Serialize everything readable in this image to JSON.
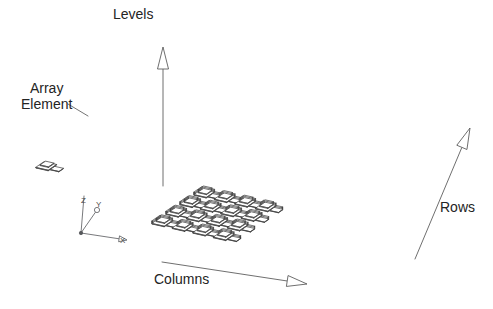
{
  "figure": {
    "background_color": "#ffffff",
    "line_color": "#3a3a3a",
    "text_color": "#242424",
    "width": 493,
    "height": 309
  },
  "labels": {
    "levels": "Levels",
    "array_element_line1": "Array",
    "array_element_line2": "Element",
    "columns": "Columns",
    "rows": "Rows"
  },
  "axes_triad": {
    "x": "X",
    "y": "Y",
    "z": "Z",
    "origin": [
      81,
      233
    ]
  },
  "arrows": {
    "levels": {
      "direction": "up",
      "from": [
        163,
        186
      ],
      "to": [
        163,
        47
      ]
    },
    "columns": {
      "direction": "right-down",
      "from": [
        162,
        262
      ],
      "to": [
        307,
        284
      ]
    },
    "rows": {
      "direction": "up-right",
      "from": [
        415,
        259
      ],
      "to": [
        470,
        128
      ]
    }
  },
  "chart_data": {
    "type": "diagram",
    "lattice": {
      "columns": 4,
      "rows": 4,
      "levels": 3,
      "description": "Isometric 4 x 4 x 3 lattice of identical array elements"
    },
    "element_parts": [
      "upper-box",
      "body-cube",
      "horn-pyramid",
      "waveguide-rod"
    ]
  }
}
